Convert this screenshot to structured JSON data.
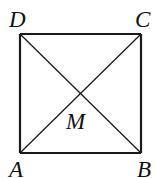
{
  "diagram": {
    "type": "geometry",
    "shape": "square",
    "vertices": {
      "A": {
        "label": "A",
        "x": 20,
        "y": 153
      },
      "B": {
        "label": "B",
        "x": 141,
        "y": 153
      },
      "C": {
        "label": "C",
        "x": 141,
        "y": 34
      },
      "D": {
        "label": "D",
        "x": 20,
        "y": 34
      }
    },
    "center": {
      "label": "M",
      "x": 80.5,
      "y": 93.5
    },
    "segments": [
      {
        "from": "A",
        "to": "B",
        "kind": "side"
      },
      {
        "from": "B",
        "to": "C",
        "kind": "side"
      },
      {
        "from": "C",
        "to": "D",
        "kind": "side"
      },
      {
        "from": "D",
        "to": "A",
        "kind": "side"
      },
      {
        "from": "A",
        "to": "C",
        "kind": "diagonal"
      },
      {
        "from": "D",
        "to": "B",
        "kind": "diagonal"
      }
    ],
    "labels": {
      "A": "A",
      "B": "B",
      "C": "C",
      "D": "D",
      "M": "M"
    },
    "colors": {
      "line": "#1a1a1a",
      "background": "#ffffff"
    }
  }
}
